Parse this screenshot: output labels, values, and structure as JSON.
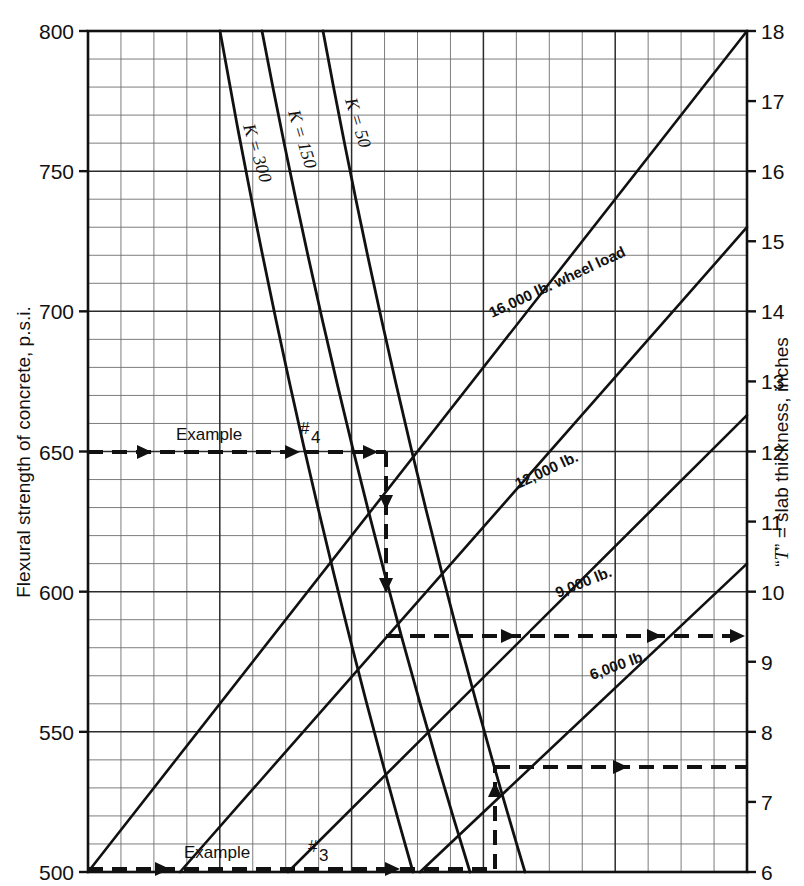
{
  "figure": {
    "kind": "nomograph",
    "background": "#ffffff",
    "ink": "#111111",
    "grid_major_color": "#2b2b2b",
    "grid_minor_color": "#6e6e6e"
  },
  "axes": {
    "left": {
      "title": "Flexural strength of concrete, p.s.i.",
      "ticks": [
        "800",
        "750",
        "700",
        "650",
        "600",
        "550",
        "500"
      ],
      "min": 500,
      "max": 800,
      "major_step": 50,
      "minor_step": 10
    },
    "right": {
      "title_prefix": "“",
      "title_italic": "T",
      "title_suffix": "” = slab thickness, inches",
      "title_full": "“T” = slab thickness, inches",
      "ticks": [
        "18",
        "17",
        "16",
        "15",
        "14",
        "13",
        "12",
        "11",
        "10",
        "9",
        "8",
        "7",
        "6"
      ],
      "min": 6,
      "max": 18,
      "major_step": 1,
      "minor_step": 0.5
    }
  },
  "k_curves": [
    {
      "label": "K = 300",
      "value": 300
    },
    {
      "label": "K = 150",
      "value": 150
    },
    {
      "label": "K = 50",
      "value": 50
    }
  ],
  "load_curves": [
    {
      "label": "16,000 lb. wheel load",
      "value": 16000
    },
    {
      "label": "12,000 lb.",
      "value": 12000
    },
    {
      "label": "9,000 lb.",
      "value": 9000
    },
    {
      "label": "6,000 lb.",
      "value": 6000
    }
  ],
  "annotations": [
    {
      "name": "example-4",
      "text": "Example ",
      "sup": "4",
      "hash": "#",
      "strength": 650,
      "thickness": 9
    },
    {
      "name": "example-3",
      "text": "Example ",
      "sup": "3",
      "hash": "#",
      "strength": 500,
      "thickness": 7.5
    }
  ],
  "chart_data": {
    "type": "line",
    "title": "",
    "xlabel": "",
    "ylabel": "Flexural strength of concrete, p.s.i.",
    "y2label": "“T” = slab thickness, inches",
    "ylim": [
      500,
      800
    ],
    "y2lim": [
      6,
      18
    ],
    "grid": true,
    "legend": "inline-curve-labels",
    "series": [
      {
        "name": "K = 300",
        "kind": "k-curve",
        "points": [
          [
            220,
            800
          ],
          [
            413,
            500
          ]
        ]
      },
      {
        "name": "K = 150",
        "kind": "k-curve",
        "points": [
          [
            262,
            800
          ],
          [
            470,
            500
          ]
        ]
      },
      {
        "name": "K = 50",
        "kind": "k-curve",
        "points": [
          [
            323,
            800
          ],
          [
            525,
            500
          ]
        ]
      },
      {
        "name": "16,000 lb. wheel load",
        "kind": "load-curve",
        "points": [
          [
            88,
            500
          ],
          [
            747,
            800
          ]
        ]
      },
      {
        "name": "12,000 lb.",
        "kind": "load-curve",
        "points": [
          [
            180,
            500
          ],
          [
            747,
            730
          ]
        ]
      },
      {
        "name": "9,000 lb.",
        "kind": "load-curve",
        "points": [
          [
            288,
            500
          ],
          [
            747,
            663
          ]
        ]
      },
      {
        "name": "6,000 lb.",
        "kind": "load-curve",
        "points": [
          [
            420,
            500
          ],
          [
            747,
            610
          ]
        ]
      }
    ],
    "annotated_examples": [
      {
        "name": "Example #4",
        "flexural_strength": 650,
        "slab_thickness": 9,
        "wheel_load": 12000,
        "path": "left-650 → K curve → down → 12,000 lb → right → 9"
      },
      {
        "name": "Example #3",
        "flexural_strength": 500,
        "slab_thickness": 7.5,
        "wheel_load": 6000,
        "path": "left-500 → right → up → 6,000 lb → right → 7.5"
      }
    ]
  }
}
